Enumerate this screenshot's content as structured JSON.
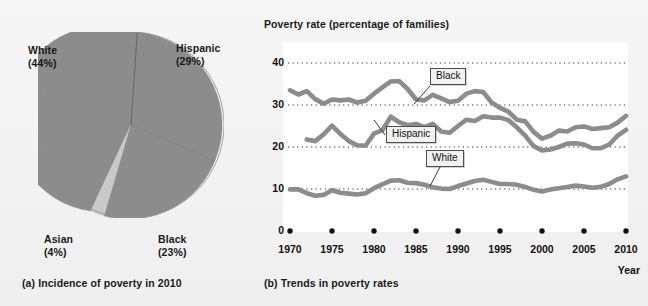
{
  "figure": {
    "panel_a_caption": "(a) Incidence of poverty in 2010",
    "panel_b_caption": "(b) Trends in poverty rates"
  },
  "colors": {
    "page_background": "#f1f1f1",
    "plot_background": "#ffffff",
    "series_gray": "#8c8c8c",
    "pie_slice_gray": "#8c8c8c",
    "pie_slice_light": "#c9c9c9",
    "gridline": "#333333",
    "text": "#1a1a1a"
  },
  "pie_chart": {
    "type": "pie",
    "title": "",
    "labels": [
      "White",
      "Hispanic",
      "Black",
      "Asian"
    ],
    "values": [
      44,
      29,
      23,
      4
    ],
    "label_texts": [
      {
        "name": "White",
        "pct": "(44%)"
      },
      {
        "name": "Hispanic",
        "pct": "(29%)"
      },
      {
        "name": "Black",
        "pct": "(23%)"
      },
      {
        "name": "Asian",
        "pct": "(4%)"
      }
    ]
  },
  "line_chart": {
    "type": "line",
    "title": "Poverty rate (percentage of families)",
    "xlabel": "Year",
    "ylabel": "",
    "ylim": [
      0,
      40
    ],
    "xlim": [
      1970,
      2010
    ],
    "yticks": [
      "40",
      "30",
      "20",
      "10",
      "0"
    ],
    "ytick_values": [
      40,
      30,
      20,
      10,
      0
    ],
    "xticks": [
      "1970",
      "1975",
      "1980",
      "1985",
      "1990",
      "1995",
      "2000",
      "2005",
      "2010"
    ],
    "xtick_values": [
      1970,
      1975,
      1980,
      1985,
      1990,
      1995,
      2000,
      2005,
      2010
    ],
    "grid": "horizontal dotted at 10, 20, 30, 40",
    "legend_position": "inline callout labels",
    "series": [
      {
        "name": "Black",
        "x": [
          1970,
          1971,
          1972,
          1973,
          1974,
          1975,
          1976,
          1977,
          1978,
          1979,
          1980,
          1981,
          1982,
          1983,
          1984,
          1985,
          1986,
          1987,
          1988,
          1989,
          1990,
          1991,
          1992,
          1993,
          1994,
          1995,
          1996,
          1997,
          1998,
          1999,
          2000,
          2001,
          2002,
          2003,
          2004,
          2005,
          2006,
          2007,
          2008,
          2009,
          2010
        ],
        "values": [
          33.5,
          32.5,
          33.3,
          31.4,
          30.3,
          31.3,
          31.1,
          31.3,
          30.6,
          31.0,
          32.7,
          34.2,
          35.6,
          35.7,
          33.8,
          31.3,
          31.1,
          32.4,
          31.6,
          30.7,
          31.0,
          32.7,
          33.3,
          33.1,
          30.6,
          29.3,
          28.4,
          26.5,
          26.1,
          23.6,
          22.0,
          22.7,
          23.9,
          23.7,
          24.7,
          24.9,
          24.3,
          24.5,
          24.7,
          25.8,
          27.4
        ]
      },
      {
        "name": "Hispanic",
        "x": [
          1972,
          1973,
          1974,
          1975,
          1976,
          1977,
          1978,
          1979,
          1980,
          1981,
          1982,
          1983,
          1984,
          1985,
          1986,
          1987,
          1988,
          1989,
          1990,
          1991,
          1992,
          1993,
          1994,
          1995,
          1996,
          1997,
          1998,
          1999,
          2000,
          2001,
          2002,
          2003,
          2004,
          2005,
          2006,
          2007,
          2008,
          2009,
          2010
        ],
        "values": [
          21.8,
          21.4,
          23.0,
          25.1,
          23.1,
          21.4,
          20.4,
          20.3,
          23.2,
          24.0,
          27.2,
          25.9,
          25.2,
          25.5,
          24.7,
          25.5,
          23.7,
          23.4,
          25.0,
          26.5,
          26.2,
          27.3,
          27.0,
          27.0,
          26.4,
          24.7,
          22.7,
          20.2,
          19.2,
          19.4,
          20.0,
          20.8,
          20.9,
          20.6,
          19.7,
          19.7,
          20.6,
          22.7,
          24.1
        ]
      },
      {
        "name": "White",
        "x": [
          1970,
          1971,
          1972,
          1973,
          1974,
          1975,
          1976,
          1977,
          1978,
          1979,
          1980,
          1981,
          1982,
          1983,
          1984,
          1985,
          1986,
          1987,
          1988,
          1989,
          1990,
          1991,
          1992,
          1993,
          1994,
          1995,
          1996,
          1997,
          1998,
          1999,
          2000,
          2001,
          2002,
          2003,
          2004,
          2005,
          2006,
          2007,
          2008,
          2009,
          2010
        ],
        "values": [
          9.9,
          9.9,
          9.0,
          8.4,
          8.6,
          9.7,
          9.1,
          8.9,
          8.7,
          9.0,
          10.2,
          11.1,
          12.0,
          12.1,
          11.5,
          11.4,
          11.0,
          10.4,
          10.1,
          10.0,
          10.7,
          11.3,
          11.9,
          12.2,
          11.7,
          11.2,
          11.2,
          11.0,
          10.5,
          9.8,
          9.4,
          9.9,
          10.2,
          10.5,
          10.8,
          10.6,
          10.3,
          10.5,
          11.2,
          12.3,
          13.0
        ]
      }
    ],
    "callouts": [
      {
        "label": "Black",
        "target_series": "Black"
      },
      {
        "label": "Hispanic",
        "target_series": "Hispanic"
      },
      {
        "label": "White",
        "target_series": "White"
      }
    ]
  }
}
